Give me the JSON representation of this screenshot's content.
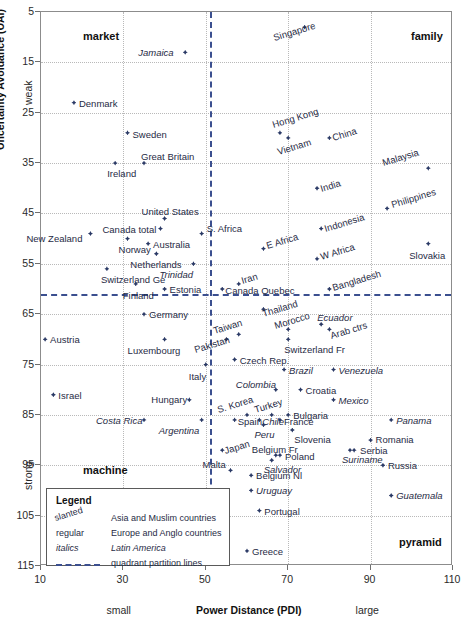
{
  "chart_data": {
    "type": "scatter",
    "title": "",
    "xlabel": "Power Distance (PDI)",
    "ylabel": "Uncertainty Avoidance (UAI)",
    "xlim": [
      10,
      110
    ],
    "ylim": [
      5,
      115
    ],
    "y_inverted": true,
    "xticks": [
      10,
      30,
      50,
      70,
      90,
      110
    ],
    "yticks": [
      5,
      15,
      25,
      35,
      45,
      55,
      65,
      75,
      85,
      95,
      105,
      115
    ],
    "grid": true,
    "x_axis_end_low": "small",
    "x_axis_end_high": "large",
    "y_axis_end_low": "weak",
    "y_axis_end_high": "strong",
    "quadrant_partitions": {
      "x": 51,
      "y": 61,
      "label": "quadrant partition lines"
    },
    "quadrant_labels": [
      {
        "name": "market",
        "corner": "top-left"
      },
      {
        "name": "family",
        "corner": "top-right"
      },
      {
        "name": "machine",
        "corner": "bottom-left"
      },
      {
        "name": "pyramid",
        "corner": "bottom-right"
      }
    ],
    "legend": {
      "title": "Legend",
      "entries": [
        {
          "key": "slanted",
          "value": "Asia and Muslim countries",
          "style": "slant"
        },
        {
          "key": "regular",
          "value": "Europe and Anglo countries",
          "style": "regular"
        },
        {
          "key": "italics",
          "value": "Latin America",
          "style": "italic"
        },
        {
          "key": "line",
          "value": "quadrant partition lines",
          "style": "line"
        }
      ]
    },
    "points": [
      {
        "name": "Singapore",
        "pdi": 74,
        "uai": 8,
        "style": "slant",
        "lx": -30,
        "ly": 13
      },
      {
        "name": "Jamaica",
        "pdi": 45,
        "uai": 13,
        "style": "italic",
        "lx": -47,
        "ly": 3
      },
      {
        "name": "Denmark",
        "pdi": 18,
        "uai": 23,
        "style": "regular",
        "lx": 5,
        "ly": 3
      },
      {
        "name": "Sweden",
        "pdi": 31,
        "uai": 29,
        "style": "regular",
        "lx": 5,
        "ly": 4
      },
      {
        "name": "Hong Kong",
        "pdi": 68,
        "uai": 29,
        "style": "slant",
        "lx": -6,
        "ly": -6
      },
      {
        "name": "China",
        "pdi": 80,
        "uai": 30,
        "style": "slant",
        "lx": 5,
        "ly": 2
      },
      {
        "name": "Vietnam",
        "pdi": 70,
        "uai": 30,
        "style": "slant",
        "lx": -9,
        "ly": 16
      },
      {
        "name": "Ireland",
        "pdi": 28,
        "uai": 35,
        "style": "regular",
        "lx": -8,
        "ly": 13
      },
      {
        "name": "Great Britain",
        "pdi": 35,
        "uai": 35,
        "style": "regular",
        "lx": -3,
        "ly": -4
      },
      {
        "name": "Malaysia",
        "pdi": 104,
        "uai": 36,
        "style": "slant",
        "lx": -44,
        "ly": -3
      },
      {
        "name": "India",
        "pdi": 77,
        "uai": 40,
        "style": "slant",
        "lx": 5,
        "ly": 3
      },
      {
        "name": "United States",
        "pdi": 40,
        "uai": 46,
        "style": "regular",
        "lx": -23,
        "ly": -4
      },
      {
        "name": "Philippines",
        "pdi": 94,
        "uai": 44,
        "style": "slant",
        "lx": 6,
        "ly": -1
      },
      {
        "name": "Canada total",
        "pdi": 39,
        "uai": 48,
        "style": "regular",
        "lx": -58,
        "ly": 3
      },
      {
        "name": "S. Africa",
        "pdi": 49,
        "uai": 49,
        "style": "regular",
        "lx": 5,
        "ly": -3
      },
      {
        "name": "New Zealand",
        "pdi": 22,
        "uai": 49,
        "style": "regular",
        "lx": -64,
        "ly": 7
      },
      {
        "name": "Norway",
        "pdi": 31,
        "uai": 50,
        "style": "regular",
        "lx": -9,
        "ly": 13
      },
      {
        "name": "Australia",
        "pdi": 36,
        "uai": 51,
        "style": "regular",
        "lx": 5,
        "ly": 3
      },
      {
        "name": "Indonesia",
        "pdi": 78,
        "uai": 48,
        "style": "slant",
        "lx": 5,
        "ly": 2
      },
      {
        "name": "Slovakia",
        "pdi": 104,
        "uai": 51,
        "style": "regular",
        "lx": -19,
        "ly": 14
      },
      {
        "name": "Netherlands",
        "pdi": 38,
        "uai": 53,
        "style": "regular",
        "lx": -26,
        "ly": 13
      },
      {
        "name": "E Africa",
        "pdi": 64,
        "uai": 52,
        "style": "slant",
        "lx": 5,
        "ly": -1
      },
      {
        "name": "W Africa",
        "pdi": 77,
        "uai": 54,
        "style": "slant",
        "lx": 5,
        "ly": 0
      },
      {
        "name": "Trinidad",
        "pdi": 47,
        "uai": 55,
        "style": "italic",
        "lx": -34,
        "ly": 13
      },
      {
        "name": "Switzerland Ge",
        "pdi": 26,
        "uai": 56,
        "style": "regular",
        "lx": -6,
        "ly": 13
      },
      {
        "name": "Finland",
        "pdi": 33,
        "uai": 59,
        "style": "regular",
        "lx": -13,
        "ly": 14
      },
      {
        "name": "Estonia",
        "pdi": 40,
        "uai": 60,
        "style": "regular",
        "lx": 5,
        "ly": 3
      },
      {
        "name": "Iran",
        "pdi": 58,
        "uai": 59,
        "style": "slant",
        "lx": 4,
        "ly": -1
      },
      {
        "name": "Canada Quebec",
        "pdi": 54,
        "uai": 60,
        "style": "regular",
        "lx": 3,
        "ly": 4
      },
      {
        "name": "Bangladesh",
        "pdi": 80,
        "uai": 60,
        "style": "slant",
        "lx": 5,
        "ly": 1
      },
      {
        "name": "Germany",
        "pdi": 35,
        "uai": 65,
        "style": "regular",
        "lx": 5,
        "ly": 3
      },
      {
        "name": "Thailand",
        "pdi": 64,
        "uai": 64,
        "style": "slant",
        "lx": 1,
        "ly": 7
      },
      {
        "name": "Ecuador",
        "pdi": 78,
        "uai": 67,
        "style": "italic",
        "lx": -4,
        "ly": -4
      },
      {
        "name": "Austria",
        "pdi": 11,
        "uai": 70,
        "style": "regular",
        "lx": 5,
        "ly": 3
      },
      {
        "name": "Taiwan",
        "pdi": 58,
        "uai": 69,
        "style": "slant",
        "lx": -24,
        "ly": -1
      },
      {
        "name": "Morocco",
        "pdi": 70,
        "uai": 68,
        "style": "slant",
        "lx": -12,
        "ly": -1
      },
      {
        "name": "Luxembourg",
        "pdi": 40,
        "uai": 70,
        "style": "regular",
        "lx": -37,
        "ly": 14
      },
      {
        "name": "Pakistan",
        "pdi": 55,
        "uai": 70,
        "style": "slant",
        "lx": -30,
        "ly": 13
      },
      {
        "name": "Arab ctrs",
        "pdi": 80,
        "uai": 68,
        "style": "slant",
        "lx": 3,
        "ly": 9
      },
      {
        "name": "Switzerland Fr",
        "pdi": 70,
        "uai": 70,
        "style": "regular",
        "lx": -4,
        "ly": 13
      },
      {
        "name": "Czech Rep.",
        "pdi": 57,
        "uai": 74,
        "style": "regular",
        "lx": 5,
        "ly": 3
      },
      {
        "name": "Italy",
        "pdi": 50,
        "uai": 75,
        "style": "regular",
        "lx": -17,
        "ly": 14
      },
      {
        "name": "Brazil",
        "pdi": 69,
        "uai": 76,
        "style": "italic",
        "lx": 5,
        "ly": 3
      },
      {
        "name": "Venezuela",
        "pdi": 81,
        "uai": 76,
        "style": "italic",
        "lx": 5,
        "ly": 3
      },
      {
        "name": "Israel",
        "pdi": 13,
        "uai": 81,
        "style": "regular",
        "lx": 5,
        "ly": 3
      },
      {
        "name": "Colombia",
        "pdi": 67,
        "uai": 80,
        "style": "italic",
        "lx": -40,
        "ly": -3
      },
      {
        "name": "Croatia",
        "pdi": 73,
        "uai": 80,
        "style": "regular",
        "lx": 5,
        "ly": 3
      },
      {
        "name": "Hungary",
        "pdi": 46,
        "uai": 82,
        "style": "regular",
        "lx": -38,
        "ly": 2
      },
      {
        "name": "Mexico",
        "pdi": 81,
        "uai": 82,
        "style": "italic",
        "lx": 5,
        "ly": 3
      },
      {
        "name": "S. Korea",
        "pdi": 60,
        "uai": 85,
        "style": "slant",
        "lx": -28,
        "ly": -3
      },
      {
        "name": "Turkey",
        "pdi": 66,
        "uai": 85,
        "style": "slant",
        "lx": -16,
        "ly": -3
      },
      {
        "name": "Bulgaria",
        "pdi": 70,
        "uai": 85,
        "style": "regular",
        "lx": 5,
        "ly": 3
      },
      {
        "name": "Costa Rica",
        "pdi": 35,
        "uai": 86,
        "style": "italic",
        "lx": -48,
        "ly": 3
      },
      {
        "name": "Argentina",
        "pdi": 49,
        "uai": 86,
        "style": "italic",
        "lx": -43,
        "ly": 13
      },
      {
        "name": "Spain",
        "pdi": 57,
        "uai": 86,
        "style": "regular",
        "lx": 3,
        "ly": 4
      },
      {
        "name": "Chile",
        "pdi": 63,
        "uai": 86,
        "style": "italic",
        "lx": 3,
        "ly": 4
      },
      {
        "name": "France",
        "pdi": 68,
        "uai": 86,
        "style": "regular",
        "lx": 4,
        "ly": 4
      },
      {
        "name": "Panama",
        "pdi": 95,
        "uai": 86,
        "style": "italic",
        "lx": 5,
        "ly": 3
      },
      {
        "name": "Peru",
        "pdi": 64,
        "uai": 87,
        "style": "italic",
        "lx": -9,
        "ly": 12
      },
      {
        "name": "Slovenia",
        "pdi": 71,
        "uai": 88,
        "style": "regular",
        "lx": 2,
        "ly": 12
      },
      {
        "name": "Japan",
        "pdi": 54,
        "uai": 92,
        "style": "slant",
        "lx": 4,
        "ly": 3
      },
      {
        "name": "Belgium Fr",
        "pdi": 67,
        "uai": 93,
        "style": "regular",
        "lx": -24,
        "ly": -3
      },
      {
        "name": "Poland",
        "pdi": 68,
        "uai": 93,
        "style": "regular",
        "lx": 5,
        "ly": 4
      },
      {
        "name": "Serbia",
        "pdi": 86,
        "uai": 92,
        "style": "regular",
        "lx": 6,
        "ly": 3
      },
      {
        "name": "Suriname",
        "pdi": 85,
        "uai": 92,
        "style": "italic",
        "lx": -8,
        "ly": 12
      },
      {
        "name": "Romania",
        "pdi": 90,
        "uai": 90,
        "style": "regular",
        "lx": 5,
        "ly": 2
      },
      {
        "name": "Malta",
        "pdi": 56,
        "uai": 96,
        "style": "regular",
        "lx": -28,
        "ly": -3
      },
      {
        "name": "Salvador",
        "pdi": 66,
        "uai": 94,
        "style": "italic",
        "lx": -8,
        "ly": 12
      },
      {
        "name": "Russia",
        "pdi": 93,
        "uai": 95,
        "style": "regular",
        "lx": 5,
        "ly": 3
      },
      {
        "name": "Belgium Nl",
        "pdi": 61,
        "uai": 97,
        "style": "regular",
        "lx": 5,
        "ly": 3
      },
      {
        "name": "Uruguay",
        "pdi": 61,
        "uai": 100,
        "style": "italic",
        "lx": 5,
        "ly": 3
      },
      {
        "name": "Guatemala",
        "pdi": 95,
        "uai": 101,
        "style": "italic",
        "lx": 5,
        "ly": 3
      },
      {
        "name": "Portugal",
        "pdi": 63,
        "uai": 104,
        "style": "regular",
        "lx": 5,
        "ly": 3
      },
      {
        "name": "Greece",
        "pdi": 60,
        "uai": 112,
        "style": "regular",
        "lx": 5,
        "ly": 3
      }
    ]
  }
}
